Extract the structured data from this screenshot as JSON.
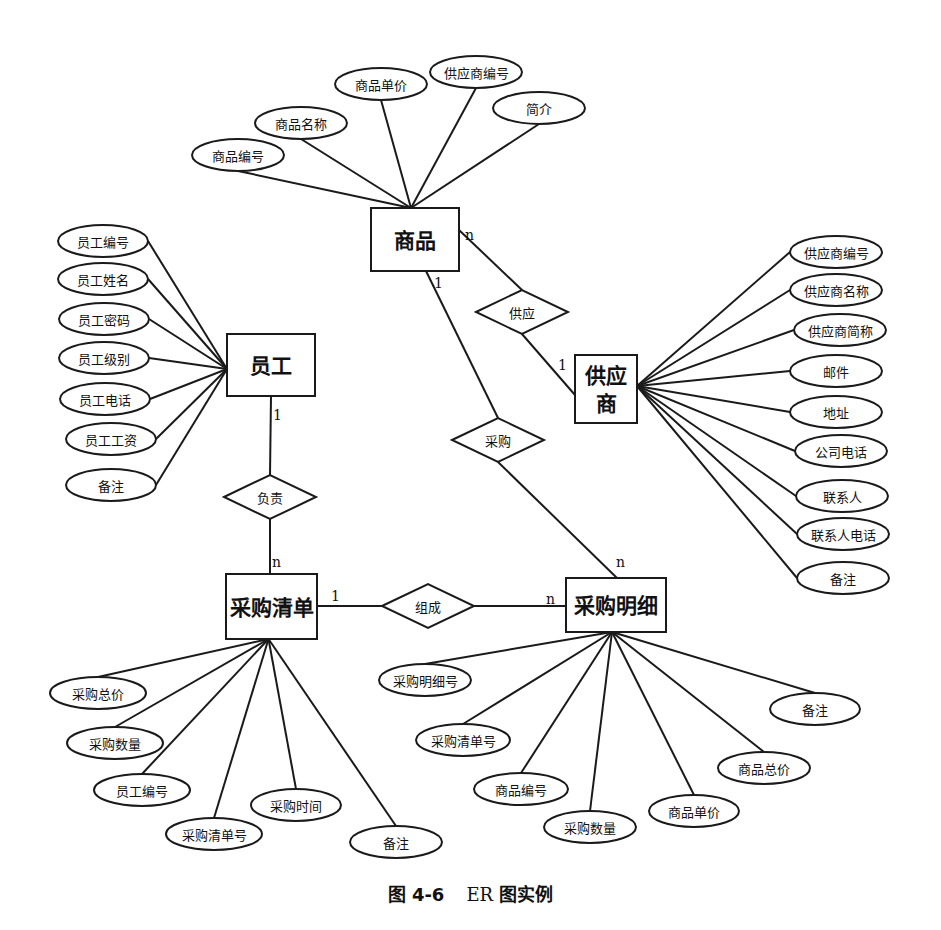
{
  "caption": {
    "figure_no": "图 4-6",
    "title_er": "ER",
    "title_rest": "图实例"
  },
  "entities": {
    "product": {
      "label": "商品",
      "x": 371,
      "y": 208,
      "w": 88,
      "h": 63
    },
    "employee": {
      "label": "员工",
      "x": 227,
      "y": 334,
      "w": 88,
      "h": 62
    },
    "supplier": {
      "label_line1": "供应",
      "label_line2": "商",
      "x": 575,
      "y": 355,
      "w": 62,
      "h": 68
    },
    "purchase_list": {
      "label": "采购清单",
      "x": 226,
      "y": 574,
      "w": 91,
      "h": 65
    },
    "purchase_detail": {
      "label": "采购明细",
      "x": 566,
      "y": 578,
      "w": 100,
      "h": 54
    }
  },
  "relationships": [
    {
      "id": "supply",
      "label": "供应",
      "cx": 522,
      "cy": 312
    },
    {
      "id": "purchase",
      "label": "采购",
      "cx": 498,
      "cy": 440
    },
    {
      "id": "responsible",
      "label": "负责",
      "cx": 270,
      "cy": 497
    },
    {
      "id": "compose",
      "label": "组成",
      "cx": 428,
      "cy": 606
    }
  ],
  "cardinalities": [
    {
      "text": "n",
      "x": 465,
      "y": 240
    },
    {
      "text": "1",
      "x": 434,
      "y": 288
    },
    {
      "text": "1",
      "x": 558,
      "y": 370
    },
    {
      "text": "1",
      "x": 273,
      "y": 420
    },
    {
      "text": "n",
      "x": 272,
      "y": 567
    },
    {
      "text": "1",
      "x": 331,
      "y": 601
    },
    {
      "text": "n",
      "x": 546,
      "y": 604
    },
    {
      "text": "n",
      "x": 616,
      "y": 567
    }
  ],
  "product_attributes": [
    {
      "label": "商品编号",
      "cx": 238,
      "cy": 155,
      "rx": 46,
      "ry": 16
    },
    {
      "label": "商品名称",
      "cx": 301,
      "cy": 123,
      "rx": 46,
      "ry": 16
    },
    {
      "label": "商品单价",
      "cx": 381,
      "cy": 84,
      "rx": 46,
      "ry": 16
    },
    {
      "label": "供应商编号",
      "cx": 476,
      "cy": 72,
      "rx": 46,
      "ry": 16
    },
    {
      "label": "简介",
      "cx": 539,
      "cy": 108,
      "rx": 46,
      "ry": 16
    }
  ],
  "employee_attributes": [
    {
      "label": "员工编号",
      "cx": 103,
      "cy": 241,
      "rx": 45,
      "ry": 16
    },
    {
      "label": "员工姓名",
      "cx": 103,
      "cy": 279,
      "rx": 45,
      "ry": 16
    },
    {
      "label": "员工密码",
      "cx": 104,
      "cy": 319,
      "rx": 45,
      "ry": 16
    },
    {
      "label": "员工级别",
      "cx": 104,
      "cy": 358,
      "rx": 45,
      "ry": 16
    },
    {
      "label": "员工电话",
      "cx": 105,
      "cy": 399,
      "rx": 45,
      "ry": 16
    },
    {
      "label": "员工工资",
      "cx": 111,
      "cy": 439,
      "rx": 45,
      "ry": 16
    },
    {
      "label": "备注",
      "cx": 111,
      "cy": 485,
      "rx": 45,
      "ry": 16
    }
  ],
  "supplier_attributes": [
    {
      "label": "供应商编号",
      "cx": 836,
      "cy": 252,
      "rx": 46,
      "ry": 16
    },
    {
      "label": "供应商名称",
      "cx": 836,
      "cy": 290,
      "rx": 46,
      "ry": 16
    },
    {
      "label": "供应商简称",
      "cx": 840,
      "cy": 330,
      "rx": 46,
      "ry": 16
    },
    {
      "label": "邮件",
      "cx": 836,
      "cy": 371,
      "rx": 46,
      "ry": 16
    },
    {
      "label": "地址",
      "cx": 836,
      "cy": 412,
      "rx": 46,
      "ry": 16
    },
    {
      "label": "公司电话",
      "cx": 841,
      "cy": 451,
      "rx": 46,
      "ry": 16
    },
    {
      "label": "联系人",
      "cx": 842,
      "cy": 496,
      "rx": 46,
      "ry": 16
    },
    {
      "label": "联系人电话",
      "cx": 843,
      "cy": 534,
      "rx": 46,
      "ry": 16
    },
    {
      "label": "备注",
      "cx": 843,
      "cy": 578,
      "rx": 46,
      "ry": 16
    }
  ],
  "purchase_list_attributes": [
    {
      "label": "采购总价",
      "cx": 98,
      "cy": 693,
      "rx": 48,
      "ry": 16
    },
    {
      "label": "采购数量",
      "cx": 115,
      "cy": 743,
      "rx": 48,
      "ry": 16
    },
    {
      "label": "员工编号",
      "cx": 142,
      "cy": 790,
      "rx": 48,
      "ry": 16
    },
    {
      "label": "采购清单号",
      "cx": 214,
      "cy": 834,
      "rx": 48,
      "ry": 16
    },
    {
      "label": "采购时间",
      "cx": 296,
      "cy": 805,
      "rx": 45,
      "ry": 16
    },
    {
      "label": "备注",
      "cx": 396,
      "cy": 842,
      "rx": 46,
      "ry": 16
    }
  ],
  "purchase_detail_attributes": [
    {
      "label": "采购明细号",
      "cx": 425,
      "cy": 680,
      "rx": 46,
      "ry": 16
    },
    {
      "label": "采购清单号",
      "cx": 463,
      "cy": 740,
      "rx": 47,
      "ry": 16
    },
    {
      "label": "商品编号",
      "cx": 521,
      "cy": 789,
      "rx": 47,
      "ry": 16
    },
    {
      "label": "采购数量",
      "cx": 590,
      "cy": 827,
      "rx": 46,
      "ry": 16
    },
    {
      "label": "商品单价",
      "cx": 694,
      "cy": 811,
      "rx": 45,
      "ry": 16
    },
    {
      "label": "商品总价",
      "cx": 764,
      "cy": 768,
      "rx": 46,
      "ry": 16
    },
    {
      "label": "备注",
      "cx": 815,
      "cy": 709,
      "rx": 45,
      "ry": 16
    }
  ]
}
